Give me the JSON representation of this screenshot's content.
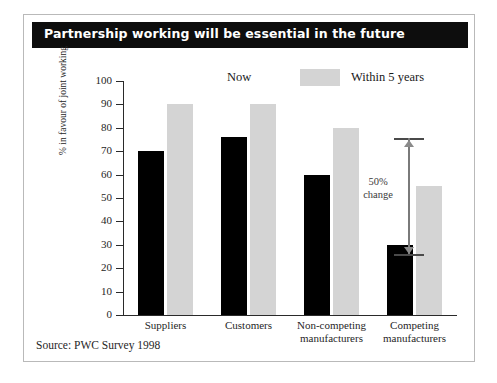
{
  "title": "Partnership working will be essential in the future",
  "source": "Source: PWC Survey 1998",
  "legend": {
    "now": "Now",
    "future": "Within 5 years"
  },
  "annotation": {
    "line1": "50%",
    "line2": "change"
  },
  "colors": {
    "now": "#000000",
    "future": "#d4d4d4",
    "title_bar": "#0d0d0d",
    "title_text": "#ffffff",
    "frame": "#b9b9b9"
  },
  "chart_data": {
    "type": "bar",
    "title": "Partnership working will be essential in the future",
    "xlabel": "",
    "ylabel": "% in favour of joint working",
    "ylim": [
      0,
      100
    ],
    "yticks": [
      0,
      10,
      20,
      30,
      40,
      50,
      60,
      70,
      80,
      90,
      100
    ],
    "grid": false,
    "legend_position": "top-center",
    "categories": [
      "Suppliers",
      "Customers",
      "Non-competing manufacturers",
      "Competing manufacturers"
    ],
    "category_lines": [
      [
        "Suppliers",
        ""
      ],
      [
        "Customers",
        ""
      ],
      [
        "Non-competing",
        "manufacturers"
      ],
      [
        "Competing",
        "manufacturers"
      ]
    ],
    "series": [
      {
        "name": "Now",
        "color": "#000000",
        "values": [
          70,
          76,
          60,
          30
        ]
      },
      {
        "name": "Within 5 years",
        "color": "#d4d4d4",
        "values": [
          90,
          90,
          80,
          55
        ]
      }
    ],
    "annotations": [
      {
        "text": "50% change",
        "category": "Competing manufacturers",
        "from": 30,
        "to": 55
      }
    ]
  }
}
